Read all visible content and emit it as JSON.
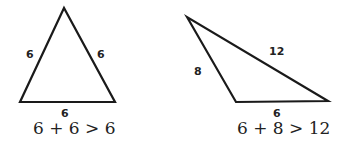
{
  "diagram": {
    "colors": {
      "stroke": "#1a1a1a",
      "text": "#222222",
      "background": "#ffffff"
    },
    "triangles": [
      {
        "name": "isosceles-equilateral",
        "side_labels": {
          "left": "6",
          "right": "6",
          "bottom": "6"
        },
        "inequality": "6 + 6 > 6"
      },
      {
        "name": "scalene",
        "side_labels": {
          "hypotenuse": "12",
          "left": "8",
          "bottom": "6"
        },
        "inequality": "6 + 8 > 12"
      }
    ]
  }
}
